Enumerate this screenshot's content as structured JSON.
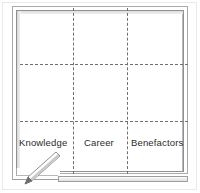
{
  "illustration": {
    "kind": "whiteboard-grid-diagram",
    "title": "",
    "board": {
      "rows": 3,
      "columns": 3,
      "grid_style": "dashed",
      "grid_color": "#6f7073",
      "frame_color": "#9d9ea1",
      "face_color": "#ffffff"
    },
    "cells": {
      "bottom_row_labels": [
        {
          "name": "knowledge",
          "label": "Knowledge"
        },
        {
          "name": "career",
          "label": "Career"
        },
        {
          "name": "benefactors",
          "label": "Benefactors"
        }
      ]
    },
    "decorations": [
      {
        "name": "pencil-icon",
        "label": "",
        "orientation": "diagonal-up-right"
      },
      {
        "name": "shelf",
        "label": ""
      },
      {
        "name": "frame-foot",
        "label": ""
      }
    ]
  }
}
